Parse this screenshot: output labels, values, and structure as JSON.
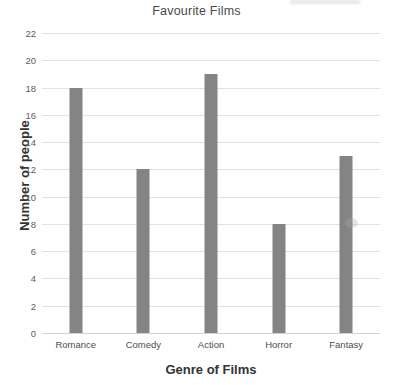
{
  "chart_data": {
    "type": "bar",
    "title": "Favourite Films",
    "xlabel": "Genre of Films",
    "ylabel": "Number of people",
    "categories": [
      "Romance",
      "Comedy",
      "Action",
      "Horror",
      "Fantasy"
    ],
    "values": [
      18,
      12,
      19,
      8,
      13
    ],
    "ylim": [
      0,
      22
    ],
    "ytick_step": 2,
    "yticks": [
      0,
      2,
      4,
      6,
      8,
      10,
      12,
      14,
      16,
      18,
      20,
      22
    ],
    "ytick_labels": [
      "0",
      "2",
      "4",
      "6",
      "8",
      "10",
      "12",
      "14",
      "16",
      "18",
      "20",
      "22"
    ],
    "grid": "horizontal",
    "legend": "none",
    "bar_color": "#848484",
    "gridline_color": "#e2e2e2",
    "background_color": "#ffffff",
    "title_color": "#4a4a4a",
    "axis_title_color": "#333333",
    "tick_label_color": "#5d5d5d"
  }
}
